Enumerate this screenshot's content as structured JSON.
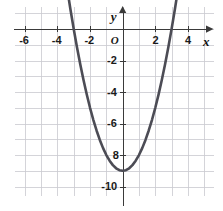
{
  "figure": {
    "name": "parabola-coordinate-plane",
    "background_color": "#ffffff",
    "grid_color": "#c9c9cf",
    "axis_color": "#3a3a3a",
    "curve_color": "#4c4c55",
    "label_color": "#1a1a1a"
  },
  "axes": {
    "x_name": "x",
    "y_name": "y",
    "origin_label": "O",
    "x_ticks": [
      {
        "value": -6,
        "label": "-6"
      },
      {
        "value": -4,
        "label": "-4"
      },
      {
        "value": -2,
        "label": "-2"
      },
      {
        "value": 2,
        "label": "2"
      },
      {
        "value": 4,
        "label": "4"
      }
    ],
    "y_ticks": [
      {
        "value": -2,
        "label": "-2"
      },
      {
        "value": -4,
        "label": "-4"
      },
      {
        "value": -6,
        "label": "-6"
      },
      {
        "value": -8,
        "label": "8"
      },
      {
        "value": -10,
        "label": "-10"
      }
    ]
  },
  "chart_data": {
    "type": "line",
    "title": "",
    "xlabel": "x",
    "ylabel": "y",
    "xlim": [
      -6.6,
      5.6
    ],
    "ylim": [
      -10.6,
      1.4
    ],
    "grid": true,
    "grid_step": 1,
    "legend": "none",
    "series": [
      {
        "name": "parabola",
        "equation": "y = x^2 - 9",
        "vertex": [
          0,
          -9
        ],
        "x_intercepts": [
          -3,
          3
        ],
        "y_intercept": -9,
        "color": "#4c4c55",
        "x": [
          -3.8,
          -3.6,
          -3.4,
          -3.2,
          -3.0,
          -2.8,
          -2.6,
          -2.4,
          -2.2,
          -2.0,
          -1.8,
          -1.6,
          -1.4,
          -1.2,
          -1.0,
          -0.8,
          -0.6,
          -0.4,
          -0.2,
          0.0,
          0.2,
          0.4,
          0.6,
          0.8,
          1.0,
          1.2,
          1.4,
          1.6,
          1.8,
          2.0,
          2.2,
          2.4,
          2.6,
          2.8,
          3.0,
          3.2,
          3.4,
          3.6,
          3.8
        ],
        "y": [
          5.44,
          3.96,
          2.56,
          1.24,
          0.0,
          -1.16,
          -2.24,
          -3.24,
          -4.16,
          -5.0,
          -5.76,
          -6.44,
          -7.04,
          -7.56,
          -8.0,
          -8.36,
          -8.64,
          -8.84,
          -8.96,
          -9.0,
          -8.96,
          -8.84,
          -8.64,
          -8.36,
          -8.0,
          -7.56,
          -7.04,
          -6.44,
          -5.76,
          -5.0,
          -4.16,
          -3.24,
          -2.24,
          -1.16,
          0.0,
          1.24,
          2.56,
          3.96,
          5.44
        ]
      }
    ]
  }
}
